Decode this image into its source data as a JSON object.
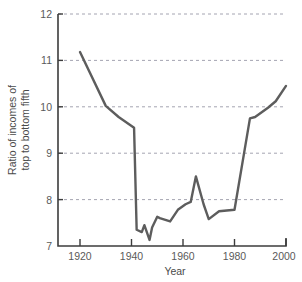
{
  "chart_data": {
    "type": "line",
    "title": "",
    "xlabel": "Year",
    "ylabel": "Ratio of incomes of top to bottom fifth",
    "ylabel_line1": "Ratio of incomes of",
    "ylabel_line2": "top to bottom fifth",
    "xlim": [
      1912,
      2002
    ],
    "ylim": [
      7,
      12
    ],
    "xticks": [
      1920,
      1940,
      1960,
      1980,
      2000
    ],
    "xtick_labels": [
      "1920",
      "1940",
      "1960",
      "1980",
      "2000"
    ],
    "yticks": [
      7,
      8,
      9,
      10,
      11,
      12
    ],
    "ytick_labels": [
      "7",
      "8",
      "9",
      "10",
      "11",
      "12"
    ],
    "grid": "horizontal-dashed",
    "legend": "none",
    "line_color": "#5d5d5d",
    "grid_color": "#9a9aa8",
    "axis_color": "#3c3c3c",
    "series": [
      {
        "name": "Ratio of incomes of top to bottom fifth",
        "x": [
          1920,
          1930,
          1935,
          1941,
          1942,
          1944,
          1945,
          1947,
          1948,
          1950,
          1951,
          1955,
          1958,
          1961,
          1963,
          1965,
          1968,
          1970,
          1974,
          1980,
          1986,
          1988,
          1993,
          1996,
          2000
        ],
        "values": [
          11.18,
          10.02,
          9.78,
          9.55,
          7.35,
          7.3,
          7.45,
          7.13,
          7.4,
          7.63,
          7.6,
          7.53,
          7.78,
          7.9,
          7.95,
          8.5,
          7.9,
          7.58,
          7.75,
          7.78,
          9.75,
          9.78,
          9.98,
          10.12,
          10.45
        ]
      }
    ]
  }
}
